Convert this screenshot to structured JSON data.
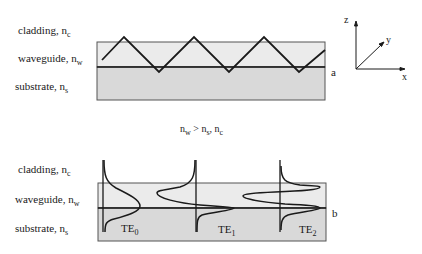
{
  "top_panel": {
    "layers": [
      {
        "name": "cladding",
        "symbol": "n",
        "sub": "c",
        "fill": "#ffffff"
      },
      {
        "name": "waveguide",
        "symbol": "n",
        "sub": "w",
        "fill": "#ebebeb"
      },
      {
        "name": "substrate",
        "symbol": "n",
        "sub": "s",
        "fill": "#dcdcdc"
      }
    ],
    "marker": "a",
    "ray_points": [
      [
        102,
        60
      ],
      [
        124,
        37
      ],
      [
        159,
        72
      ],
      [
        194,
        37
      ],
      [
        229,
        72
      ],
      [
        264,
        37
      ],
      [
        299,
        72
      ],
      [
        325,
        50
      ]
    ]
  },
  "axes": {
    "z": "z",
    "y": "y",
    "x": "x"
  },
  "condition": {
    "lhs": "n",
    "lhs_sub": "w",
    "op": ">",
    "r1": "n",
    "r1_sub": "s",
    "sep": ",",
    "r2": "n",
    "r2_sub": "c"
  },
  "bottom_panel": {
    "layers": [
      {
        "name": "cladding",
        "symbol": "n",
        "sub": "c"
      },
      {
        "name": "waveguide",
        "symbol": "n",
        "sub": "w"
      },
      {
        "name": "substrate",
        "symbol": "n",
        "sub": "s"
      }
    ],
    "marker": "b",
    "modes": [
      {
        "label": "TE",
        "order": "0"
      },
      {
        "label": "TE",
        "order": "1"
      },
      {
        "label": "TE",
        "order": "2"
      }
    ]
  },
  "colors": {
    "line": "#1a1a1a",
    "waveguide_fill": "#ebebeb",
    "substrate_fill": "#d9d9d9",
    "border": "#555555"
  }
}
